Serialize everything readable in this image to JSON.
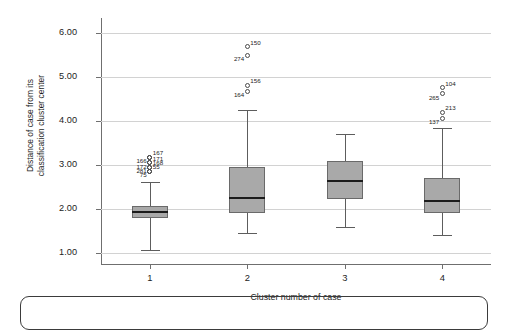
{
  "chart_data": {
    "type": "box",
    "title": "",
    "xlabel": "Cluster number of case",
    "ylabel_line1": "Distance of case from its",
    "ylabel_line2": "classification cluster center",
    "categories": [
      "1",
      "2",
      "3",
      "4"
    ],
    "ylim": [
      0.75,
      6.35
    ],
    "yticks": [
      "1.00",
      "2.00",
      "3.00",
      "4.00",
      "5.00",
      "6.00"
    ],
    "ytick_values": [
      1.0,
      2.0,
      3.0,
      4.0,
      5.0,
      6.0
    ],
    "grid": true,
    "legend": "none",
    "colors": {
      "box_fill": "#a9a9a9",
      "box_border": "#6a6a6a",
      "median": "#1c1c1c",
      "whisker": "#5d5d5d",
      "gridline": "#d2d2d2",
      "axis": "#6f6f6f",
      "text": "#1d1d1d"
    },
    "boxes": [
      {
        "category": "1",
        "whisker_low": 1.08,
        "q1": 1.8,
        "median": 1.93,
        "q3": 2.08,
        "whisker_high": 2.62,
        "outliers": [
          {
            "value": 3.18,
            "label": "167"
          },
          {
            "value": 3.18,
            "label": "166"
          },
          {
            "value": 3.05,
            "label": "171"
          },
          {
            "value": 3.05,
            "label": "172"
          },
          {
            "value": 2.95,
            "label": "168"
          },
          {
            "value": 2.95,
            "label": "281"
          },
          {
            "value": 2.86,
            "label": "55"
          },
          {
            "value": 2.86,
            "label": "75"
          }
        ]
      },
      {
        "category": "2",
        "whisker_low": 1.45,
        "q1": 1.9,
        "median": 2.25,
        "q3": 2.95,
        "whisker_high": 4.25,
        "outliers": [
          {
            "value": 5.7,
            "label": "150"
          },
          {
            "value": 5.5,
            "label": "274"
          },
          {
            "value": 4.82,
            "label": "156"
          },
          {
            "value": 4.68,
            "label": "164"
          }
        ]
      },
      {
        "category": "3",
        "whisker_low": 1.6,
        "q1": 2.22,
        "median": 2.65,
        "q3": 3.1,
        "whisker_high": 3.7,
        "outliers": []
      },
      {
        "category": "4",
        "whisker_low": 1.4,
        "q1": 1.92,
        "median": 2.18,
        "q3": 2.7,
        "whisker_high": 3.85,
        "outliers": [
          {
            "value": 4.76,
            "label": "104"
          },
          {
            "value": 4.62,
            "label": "265"
          },
          {
            "value": 4.2,
            "label": "213"
          },
          {
            "value": 4.07,
            "label": "137"
          }
        ]
      }
    ]
  }
}
